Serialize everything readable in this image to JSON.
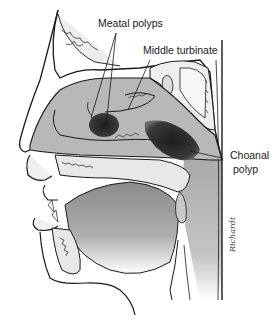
{
  "figure": {
    "labels": {
      "meatal_polyps": "Meatal polyps",
      "middle_turbinate": "Middle turbinate",
      "choanal_polyp_line1": "Choanal",
      "choanal_polyp_line2": "polyp"
    },
    "signature": "Richardt",
    "colors": {
      "outline": "#1a1a1a",
      "cavity_gray": "#b5b5b5",
      "tissue_light": "#e9e9e9",
      "polyp_dark": "#2b2b2b",
      "background": "#ffffff"
    }
  }
}
